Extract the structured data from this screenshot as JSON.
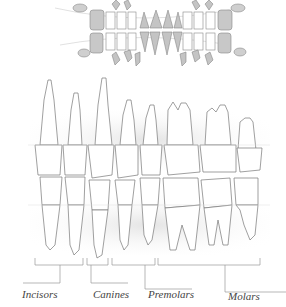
{
  "diagram": {
    "title": "",
    "top_figure": "dental-arch-x-ray-style-illustration",
    "main_figure": "side-view-permanent-teeth",
    "labels": [
      {
        "id": "incisors",
        "text": "Incisors",
        "x": 22,
        "y": 288
      },
      {
        "id": "canines",
        "text": "Canines",
        "x": 93,
        "y": 288
      },
      {
        "id": "premolars",
        "text": "Premolars",
        "x": 148,
        "y": 288
      },
      {
        "id": "molars",
        "text": "Molars",
        "x": 228,
        "y": 290
      }
    ]
  }
}
